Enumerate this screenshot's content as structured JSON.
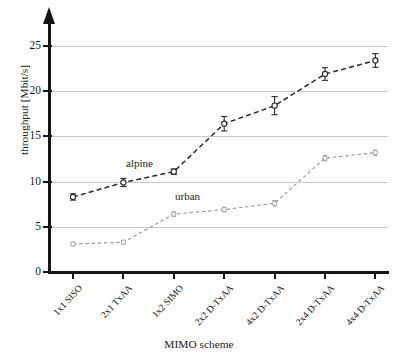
{
  "chart_data": {
    "type": "line",
    "title": "",
    "xlabel": "MIMO scheme",
    "ylabel": "throughput [Mbit/s]",
    "categories": [
      "1x1 SISO",
      "2x1 TxAA",
      "1x2 SIMO",
      "2x2 D-TxAA",
      "4x2 D-TxAA",
      "2x4 D-TxAA",
      "4x4 D-TxAA"
    ],
    "ylim": [
      0,
      26
    ],
    "yticks": [
      0,
      5,
      10,
      15,
      20,
      25
    ],
    "ytick_labels": [
      "0",
      "5",
      "10",
      "15",
      "20",
      "25"
    ],
    "grid": true,
    "legend_position": "inline-annotation",
    "series": [
      {
        "name": "alpine",
        "color": "#2a2a2a",
        "style": "dashed",
        "marker": "open-circle-with-errorbar",
        "values": [
          8.3,
          9.9,
          11.1,
          16.4,
          18.4,
          21.9,
          23.4
        ],
        "errors": [
          0.35,
          0.45,
          0.3,
          0.8,
          1.0,
          0.7,
          0.75
        ]
      },
      {
        "name": "urban",
        "color": "#9a9a9a",
        "style": "dashed",
        "marker": "open-circle-with-errorbar",
        "values": [
          3.1,
          3.3,
          6.4,
          6.9,
          7.6,
          12.6,
          13.2
        ],
        "errors": [
          0.2,
          0.2,
          0.25,
          0.25,
          0.3,
          0.3,
          0.3
        ]
      }
    ],
    "annotations": [
      {
        "text": "alpine",
        "series": "alpine"
      },
      {
        "text": "urban",
        "series": "urban"
      }
    ]
  }
}
